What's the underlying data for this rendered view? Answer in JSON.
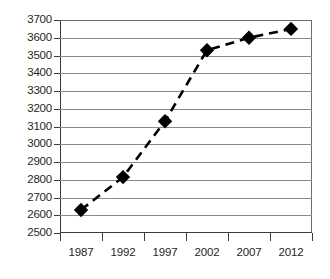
{
  "chart_data": {
    "type": "line",
    "title": "",
    "subtitle": "",
    "xlabel": "",
    "ylabel": "",
    "x": [
      1987,
      1992,
      1997,
      2002,
      2007,
      2012
    ],
    "categories": [
      "1987",
      "1992",
      "1997",
      "2002",
      "2007",
      "2012"
    ],
    "values": [
      2630,
      2815,
      3130,
      3530,
      3600,
      3650
    ],
    "series": [
      {
        "name": "series-1",
        "values": [
          2630,
          2815,
          3130,
          3530,
          3600,
          3650
        ],
        "line_style": "dashed",
        "line_color": "#000000",
        "marker": "diamond",
        "marker_color": "#000000"
      }
    ],
    "ylim": [
      2500,
      3700
    ],
    "xlim": [
      1984.5,
      2014.5
    ],
    "ytick_labels": [
      "3700",
      "3600",
      "3500",
      "3400",
      "3300",
      "3200",
      "3100",
      "3000",
      "2900",
      "2800",
      "2700",
      "2600",
      "2500"
    ],
    "ytick_values": [
      3700,
      3600,
      3500,
      3400,
      3300,
      3200,
      3100,
      3000,
      2900,
      2800,
      2700,
      2600,
      2500
    ],
    "ytick_step": 100,
    "xtick_labels": [
      "1987",
      "1992",
      "1997",
      "2002",
      "2007",
      "2012"
    ],
    "xtick_count": 7,
    "grid": "horizontal",
    "grid_color": "#8a8a8a",
    "legend": "none",
    "legend_position": "none",
    "background_color": "#ffffff",
    "axis_color": "#3b3b3b",
    "annotations": []
  }
}
